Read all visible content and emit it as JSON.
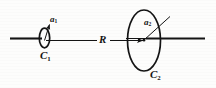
{
  "figure": {
    "kind": "physics-diagram",
    "stroke_color": "#141414",
    "background_color": "#fdfdfc",
    "labels": {
      "coil1_name": "C",
      "coil1_sub": "1",
      "coil2_name": "C",
      "coil2_sub": "2",
      "radius1_name": "a",
      "radius1_sub": "1",
      "radius2_name": "a",
      "radius2_sub": "2",
      "distance_name": "R"
    },
    "elements": {
      "axis_label": "common axis line",
      "separation_arrow_label": "R",
      "left_coil_label": "C1",
      "right_coil_label": "C2"
    }
  }
}
